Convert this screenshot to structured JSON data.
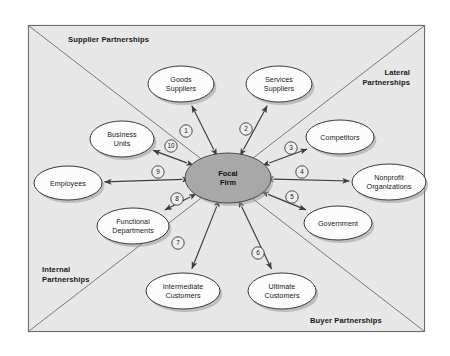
{
  "diagram": {
    "background_color": "#e9e9e9",
    "page_color": "#ffffff",
    "frame": {
      "border_color": "#6e6e6e",
      "diagonal_color": "#7a7a7a"
    },
    "quadrant_labels": [
      {
        "id": "supplier",
        "text": "Supplier Partnerships",
        "lines": [
          "Supplier Partnerships"
        ],
        "align": "left",
        "x": 68,
        "y": 42
      },
      {
        "id": "lateral",
        "text": "Lateral Partnerships",
        "lines": [
          "Lateral",
          "Partnerships"
        ],
        "align": "right",
        "x": 410,
        "y": 75
      },
      {
        "id": "internal",
        "text": "Internal Partnerships",
        "lines": [
          "Internal",
          "Partnerships"
        ],
        "align": "left",
        "x": 42,
        "y": 272
      },
      {
        "id": "buyer",
        "text": "Buyer Partnerships",
        "lines": [
          "Buyer Partnerships"
        ],
        "align": "left",
        "x": 310,
        "y": 323
      }
    ],
    "focal": {
      "id": "focal-firm",
      "lines": [
        "Focal",
        "Firm"
      ],
      "cx": 228,
      "cy": 178,
      "rx": 43,
      "ry": 25,
      "fill": "#a8a8a8"
    },
    "nodes": [
      {
        "id": "goods-suppliers",
        "lines": [
          "Goods",
          "Suppliers"
        ],
        "cx": 181,
        "cy": 84,
        "rx": 33,
        "ry": 18
      },
      {
        "id": "services-suppliers",
        "lines": [
          "Services",
          "Suppliers"
        ],
        "cx": 279,
        "cy": 84,
        "rx": 33,
        "ry": 18
      },
      {
        "id": "business-units",
        "lines": [
          "Business",
          "Units"
        ],
        "cx": 122,
        "cy": 139,
        "rx": 32,
        "ry": 18
      },
      {
        "id": "competitors",
        "lines": [
          "Competitors"
        ],
        "cx": 340,
        "cy": 137,
        "rx": 34,
        "ry": 17
      },
      {
        "id": "employees",
        "lines": [
          "Employees"
        ],
        "cx": 68,
        "cy": 183,
        "rx": 34,
        "ry": 17
      },
      {
        "id": "nonprofit-organizations",
        "lines": [
          "Nonprofit",
          "Organizations"
        ],
        "cx": 389,
        "cy": 182,
        "rx": 37,
        "ry": 18
      },
      {
        "id": "functional-departments",
        "lines": [
          "Functional",
          "Departments"
        ],
        "cx": 133,
        "cy": 226,
        "rx": 36,
        "ry": 18
      },
      {
        "id": "government",
        "lines": [
          "Government"
        ],
        "cx": 338,
        "cy": 223,
        "rx": 34,
        "ry": 17
      },
      {
        "id": "intermediate-customers",
        "lines": [
          "Intermediate",
          "Customers"
        ],
        "cx": 183,
        "cy": 291,
        "rx": 37,
        "ry": 18
      },
      {
        "id": "ultimate-customers",
        "lines": [
          "Ultimate",
          "Customers"
        ],
        "cx": 282,
        "cy": 291,
        "rx": 34,
        "ry": 18
      }
    ],
    "connectors": [
      {
        "number": "1",
        "from": "focal-firm",
        "to": "goods-suppliers",
        "arrow": "both",
        "label_x": 186,
        "label_y": 131
      },
      {
        "number": "2",
        "from": "focal-firm",
        "to": "services-suppliers",
        "arrow": "both",
        "label_x": 246,
        "label_y": 129
      },
      {
        "number": "3",
        "from": "focal-firm",
        "to": "competitors",
        "arrow": "both",
        "label_x": 291,
        "label_y": 148
      },
      {
        "number": "4",
        "from": "focal-firm",
        "to": "nonprofit-organizations",
        "arrow": "both",
        "label_x": 302,
        "label_y": 172
      },
      {
        "number": "5",
        "from": "focal-firm",
        "to": "government",
        "arrow": "both",
        "label_x": 292,
        "label_y": 197
      },
      {
        "number": "6",
        "from": "focal-firm",
        "to": "ultimate-customers",
        "arrow": "both",
        "label_x": 258,
        "label_y": 253
      },
      {
        "number": "7",
        "from": "focal-firm",
        "to": "intermediate-customers",
        "arrow": "both",
        "label_x": 178,
        "label_y": 243
      },
      {
        "number": "8",
        "from": "focal-firm",
        "to": "functional-departments",
        "arrow": "both",
        "label_x": 177,
        "label_y": 199
      },
      {
        "number": "9",
        "from": "focal-firm",
        "to": "employees",
        "arrow": "both",
        "label_x": 158,
        "label_y": 172
      },
      {
        "number": "10",
        "from": "focal-firm",
        "to": "business-units",
        "arrow": "both",
        "label_x": 171,
        "label_y": 146
      }
    ]
  }
}
